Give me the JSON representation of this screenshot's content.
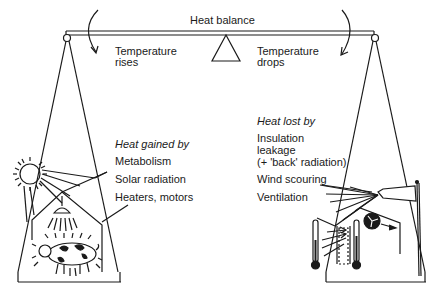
{
  "title": "Heat balance",
  "left": {
    "effect_line1": "Temperature",
    "effect_line2": "rises",
    "heading": "Heat gained by",
    "items": [
      "Metabolism",
      "Solar radiation",
      "Heaters, motors"
    ]
  },
  "right": {
    "effect_line1": "Temperature",
    "effect_line2": "drops",
    "heading": "Heat lost by",
    "items": [
      "Insulation",
      "leakage",
      "(+ 'back' radiation)",
      "Wind scouring",
      "Ventilation"
    ]
  },
  "colors": {
    "ink": "#1a1a1a",
    "background": "#ffffff"
  }
}
